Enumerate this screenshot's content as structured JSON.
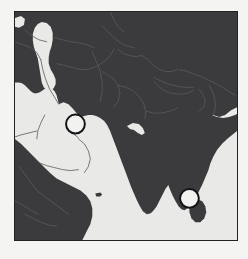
{
  "figure": {
    "kind": "map-figure",
    "width": 248,
    "height": 259,
    "page_background": "#f4f4f2"
  },
  "map": {
    "title": "",
    "region": "Middle East and South Asia",
    "projection": "equirectangular",
    "frame": {
      "border_color": "#222224",
      "border_width": 1.5,
      "x": 14,
      "y": 11,
      "width": 224,
      "height": 230
    },
    "colors": {
      "land": "#3b3b3d",
      "water": "#e9e9e7",
      "border_line": "#5a5a5c",
      "frame": "#222224",
      "marker_fill": "#f2f2f0",
      "marker_stroke": "#141416"
    },
    "water_bodies": [
      "Caspian Sea",
      "Persian Gulf",
      "Red Sea",
      "Gulf of Aden",
      "Arabian Sea",
      "Bay of Bengal"
    ],
    "land_masses": [
      "Iran",
      "Arabian Peninsula",
      "Horn of Africa",
      "Central Asia",
      "Indian Subcontinent",
      "Sri Lanka"
    ],
    "markers": [
      {
        "id": "marker-persian-gulf",
        "label": "",
        "cx": 75,
        "cy": 124,
        "r": 9.5,
        "fill": "#f2f2f0",
        "stroke": "#141416",
        "stroke_width": 2
      },
      {
        "id": "marker-palk-strait",
        "label": "",
        "cx": 190,
        "cy": 199,
        "r": 9.5,
        "fill": "#f2f2f0",
        "stroke": "#141416",
        "stroke_width": 2
      }
    ]
  }
}
